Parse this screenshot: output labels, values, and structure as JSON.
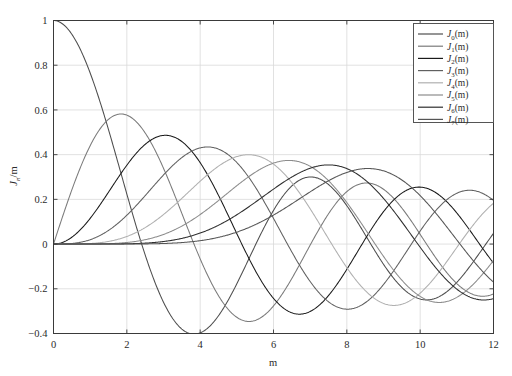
{
  "figure": {
    "background_color": "#ffffff",
    "frame_color": "#3a3a3a",
    "grid_color": "#d9d9d9"
  },
  "chart_data": {
    "type": "line",
    "title": "",
    "subtitle": "",
    "xlabel": "m",
    "ylabel": "J_n/m",
    "xlim": [
      0,
      12
    ],
    "ylim": [
      -0.4,
      1.0
    ],
    "xticks": [
      0,
      2,
      4,
      6,
      8,
      10,
      12
    ],
    "xticklabels": [
      "0",
      "2",
      "4",
      "6",
      "8",
      "10",
      "12"
    ],
    "yticks": [
      -0.4,
      -0.2,
      0,
      0.2,
      0.4,
      0.6,
      0.8,
      1.0
    ],
    "yticklabels": [
      "-0.4",
      "-0.2",
      "0",
      "0.2",
      "0.4",
      "0.6",
      "0.8",
      "1"
    ],
    "grid": true,
    "legend_position": "upper right",
    "colormap": "grayscale",
    "x": [
      0,
      0.15,
      0.3,
      0.45,
      0.6,
      0.75,
      0.9,
      1.05,
      1.2,
      1.35,
      1.5,
      1.65,
      1.8,
      1.95,
      2.1,
      2.25,
      2.4,
      2.55,
      2.7,
      2.85,
      3,
      3.15,
      3.3,
      3.45,
      3.6,
      3.75,
      3.9,
      4.05,
      4.2,
      4.35,
      4.5,
      4.65,
      4.8,
      4.95,
      5.1,
      5.25,
      5.4,
      5.55,
      5.7,
      5.85,
      6,
      6.15,
      6.3,
      6.45,
      6.6,
      6.75,
      6.9,
      7.05,
      7.2,
      7.35,
      7.5,
      7.65,
      7.8,
      7.95,
      8.1,
      8.25,
      8.4,
      8.55,
      8.7,
      8.85,
      9,
      9.15,
      9.3,
      9.45,
      9.6,
      9.75,
      9.9,
      10.05,
      10.2,
      10.35,
      10.5,
      10.65,
      10.8,
      10.95,
      11.1,
      11.25,
      11.4,
      11.55,
      11.7,
      11.85,
      12
    ],
    "series": [
      {
        "name": "J_0(m)",
        "label": "J0(m)",
        "order": 0,
        "color": "#4d4d4d",
        "first_zero": 2.405,
        "first_min": {
          "x": 3.83,
          "y": -0.403
        },
        "values": [
          1,
          0.9944,
          0.9776,
          0.95,
          0.912,
          0.8642,
          0.8075,
          0.7427,
          0.6711,
          0.5937,
          0.5118,
          0.4268,
          0.34,
          0.2528,
          0.1666,
          0.0827,
          0.0025,
          -0.0729,
          -0.1424,
          -0.2051,
          -0.2601,
          -0.3067,
          -0.3443,
          -0.3727,
          -0.3918,
          -0.4014,
          -0.4018,
          -0.3933,
          -0.3766,
          -0.3522,
          -0.3205,
          -0.2835,
          -0.2404,
          -0.1938,
          -0.1443,
          -0.093,
          -0.0412,
          0.0099,
          0.0599,
          0.1069,
          0.1506,
          0.1895,
          0.2238,
          0.2518,
          0.274,
          0.2891,
          0.2981,
          0.2998,
          0.2951,
          0.2841,
          0.2663,
          0.2441,
          0.2154,
          0.1833,
          0.1475,
          0.1093,
          0.0692,
          0.029,
          -0.0104,
          -0.048,
          -0.0903,
          -0.1206,
          -0.1467,
          -0.1697,
          -0.1872,
          -0.1992,
          -0.2055,
          -0.206,
          -0.2008,
          -0.1903,
          -0.175,
          -0.1555,
          -0.1323,
          -0.1063,
          -0.0781,
          -0.0488,
          -0.0189,
          0.0108,
          0.0395,
          0.0664,
          0.0907
        ]
      },
      {
        "name": "J_1(m)",
        "label": "J1(m)",
        "order": 1,
        "color": "#7a7a7a",
        "first_max": {
          "x": 1.84,
          "y": 0.582
        },
        "values": [
          0,
          0.0748,
          0.1483,
          0.2194,
          0.2867,
          0.3492,
          0.4059,
          0.4557,
          0.4983,
          0.5325,
          0.5579,
          0.5743,
          0.5815,
          0.5794,
          0.5683,
          0.5484,
          0.5202,
          0.4843,
          0.4416,
          0.3928,
          0.3391,
          0.2814,
          0.2207,
          0.1585,
          0.0955,
          0.0333,
          -0.0272,
          -0.0849,
          -0.1386,
          -0.1874,
          -0.2311,
          -0.2683,
          -0.2985,
          -0.3216,
          -0.3371,
          -0.3452,
          -0.346,
          -0.3396,
          -0.3265,
          -0.3071,
          -0.2767,
          -0.2476,
          -0.2136,
          -0.1761,
          -0.1361,
          -0.0947,
          -0.0527,
          -0.0113,
          0.0284,
          0.0663,
          0.1352,
          0.1643,
          0.189,
          0.2088,
          0.2235,
          0.2327,
          0.2364,
          0.2346,
          0.2274,
          0.215,
          0.2453,
          0.2291,
          0.2093,
          0.1861,
          0.16,
          0.1316,
          0.1015,
          0.0704,
          0.039,
          0.0081,
          -0.0216,
          -0.0493,
          -0.0743,
          -0.096,
          -0.1138,
          -0.1274,
          -0.1364,
          -0.1407,
          -0.1403,
          -0.1353,
          -0.1231
        ]
      },
      {
        "name": "J_2(m)",
        "label": "J2(m)",
        "order": 2,
        "color": "#1a1a1a",
        "first_max": {
          "x": 3.05,
          "y": 0.486
        },
        "values": [
          0,
          0.0028,
          0.0112,
          0.0249,
          0.0437,
          0.0673,
          0.095,
          0.1263,
          0.1604,
          0.1965,
          0.2321,
          0.2683,
          0.3028,
          0.3346,
          0.3629,
          0.3868,
          0.4059,
          0.4197,
          0.4278,
          0.4303,
          0.427,
          0.4182,
          0.4041,
          0.3851,
          0.3617,
          0.3344,
          0.3035,
          0.2699,
          0.234,
          0.1966,
          0.1584,
          0.1199,
          0.0818,
          0.0447,
          0.0092,
          -0.0243,
          -0.0553,
          -0.0835,
          -0.1085,
          -0.13,
          -0.1506,
          -0.1637,
          -0.1732,
          -0.179,
          -0.1809,
          -0.1792,
          -0.1739,
          -0.1653,
          -0.1537,
          -0.1394,
          -0.1228,
          -0.1043,
          -0.0843,
          -0.0634,
          -0.0419,
          -0.0203,
          0.001,
          0.0215,
          0.0409,
          0.0588,
          0.0849,
          0.0994,
          0.1117,
          0.1214,
          0.1285,
          0.1328,
          0.1343,
          0.133,
          0.1289,
          0.1223,
          0.1133,
          0.1022,
          0.0893,
          0.0749,
          0.0594,
          0.0432,
          0.0267,
          0.0102,
          -0.0059,
          -0.0214,
          -0.0849
        ]
      },
      {
        "name": "J_3(m)",
        "label": "J3(m)",
        "order": 3,
        "color": "#606060",
        "first_max": {
          "x": 4.2,
          "y": 0.434
        },
        "values": [
          0,
          0.0001,
          0.0006,
          0.0019,
          0.0044,
          0.0085,
          0.0144,
          0.0225,
          0.0329,
          0.0457,
          0.061,
          0.0787,
          0.0988,
          0.1209,
          0.1448,
          0.1702,
          0.1966,
          0.2235,
          0.2504,
          0.2767,
          0.3091,
          0.3243,
          0.3456,
          0.3648,
          0.3816,
          0.3957,
          0.4069,
          0.415,
          0.4198,
          0.4212,
          0.4193,
          0.4139,
          0.4052,
          0.3933,
          0.3783,
          0.3605,
          0.34,
          0.3172,
          0.2923,
          0.2657,
          0.1148,
          0.2084,
          0.178,
          0.147,
          0.1156,
          0.0843,
          0.0535,
          0.0235,
          -0.0053,
          -0.0325,
          -0.0617,
          -0.083,
          -0.103,
          -0.1207,
          -0.1358,
          -0.1482,
          -0.1577,
          -0.1642,
          -0.1677,
          -0.1682,
          -0.1809,
          -0.1776,
          -0.1716,
          -0.1631,
          -0.1523,
          -0.1394,
          -0.1247,
          -0.1085,
          -0.0912,
          -0.0731,
          -0.0545,
          -0.0358,
          -0.0173,
          0.0007,
          0.018,
          0.0344,
          0.0496,
          0.0634,
          0.0757,
          0.0862,
          0.1109
        ]
      },
      {
        "name": "J_4(m)",
        "label": "J4(m)",
        "order": 4,
        "color": "#b0b0b0",
        "first_max": {
          "x": 5.32,
          "y": 0.399
        },
        "values": [
          0,
          0.0,
          0.0,
          0.0001,
          0.0003,
          0.0008,
          0.0016,
          0.003,
          0.005,
          0.0079,
          0.0118,
          0.0169,
          0.0232,
          0.031,
          0.0402,
          0.051,
          0.0634,
          0.0774,
          0.0929,
          0.1099,
          0.132,
          0.1473,
          0.1675,
          0.1883,
          0.2095,
          0.2307,
          0.2518,
          0.2724,
          0.2922,
          0.3109,
          0.3284,
          0.3442,
          0.3582,
          0.3702,
          0.3799,
          0.3872,
          0.3919,
          0.394,
          0.3934,
          0.3901,
          0.3576,
          0.3757,
          0.3648,
          0.3515,
          0.336,
          0.3184,
          0.2988,
          0.2775,
          0.2546,
          0.2305,
          0.1981,
          0.179,
          0.1529,
          0.1265,
          0.0999,
          0.0734,
          0.0473,
          0.0218,
          -0.0028,
          -0.0263,
          -0.055,
          -0.0693,
          -0.0885,
          -0.106,
          -0.1216,
          -0.1352,
          -0.1466,
          -0.1557,
          -0.1624,
          -0.1666,
          -0.1684,
          -0.1678,
          -0.1648,
          -0.1595,
          -0.152,
          -0.1425,
          -0.1312,
          -0.1182,
          -0.1039,
          -0.0885,
          -0.0277
        ]
      },
      {
        "name": "J_5(m)",
        "label": "J5(m)",
        "order": 5,
        "color": "#8c8c8c",
        "first_max": {
          "x": 6.41,
          "y": 0.374
        },
        "values": [
          0,
          0.0,
          0.0,
          0.0,
          0.0,
          0.0001,
          0.0003,
          0.0006,
          0.0012,
          0.0021,
          0.0035,
          0.0056,
          0.0084,
          0.0122,
          0.0171,
          0.0232,
          0.0306,
          0.0395,
          0.0499,
          0.0618,
          0.043,
          0.0904,
          0.1067,
          0.1242,
          0.1427,
          0.1621,
          0.182,
          0.2022,
          0.2225,
          0.2425,
          0.2621,
          0.2809,
          0.2987,
          0.3152,
          0.3302,
          0.3434,
          0.3547,
          0.3639,
          0.3708,
          0.3754,
          0.3621,
          0.3774,
          0.3746,
          0.3691,
          0.3611,
          0.3504,
          0.3373,
          0.3217,
          0.3039,
          0.284,
          0.2538,
          0.2376,
          0.212,
          0.1857,
          0.1584,
          0.1306,
          0.1026,
          0.0746,
          0.0471,
          0.0203,
          -0.055,
          -0.0303,
          -0.0533,
          -0.0746,
          -0.0938,
          -0.1108,
          -0.1255,
          -0.1376,
          -0.147,
          -0.1537,
          -0.1577,
          -0.1589,
          -0.1575,
          -0.1535,
          -0.147,
          -0.1383,
          -0.1274,
          -0.1147,
          -0.1005,
          -0.085,
          -0.0735
        ]
      },
      {
        "name": "J_6(m)",
        "label": "J6(m)",
        "order": 6,
        "color": "#2e2e2e",
        "first_max": {
          "x": 7.5,
          "y": 0.354
        },
        "values": [
          0,
          0.0,
          0.0,
          0.0,
          0.0,
          0.0,
          0.0,
          0.0001,
          0.0002,
          0.0004,
          0.0009,
          0.0015,
          0.0025,
          0.0039,
          0.0058,
          0.0084,
          0.0118,
          0.0161,
          0.0214,
          0.0279,
          0.0114,
          0.0447,
          0.0555,
          0.0678,
          0.0815,
          0.0966,
          0.1131,
          0.1307,
          0.1492,
          0.1685,
          0.1881,
          0.2079,
          0.2275,
          0.2467,
          0.2651,
          0.2824,
          0.2984,
          0.3127,
          0.3252,
          0.3356,
          0.2458,
          0.3496,
          0.3527,
          0.353,
          0.3505,
          0.3452,
          0.3371,
          0.3263,
          0.3128,
          0.2969,
          0.2787,
          0.2528,
          0.2298,
          0.2054,
          0.1798,
          0.1532,
          0.1259,
          0.0982,
          0.0704,
          0.0428,
          0.0454,
          -0.0107,
          -0.0358,
          -0.0594,
          -0.0812,
          -0.1009,
          -0.1183,
          -0.1331,
          -0.1452,
          -0.1544,
          -0.1605,
          -0.1636,
          -0.1637,
          -0.1608,
          -0.155,
          -0.1465,
          -0.1354,
          -0.1221,
          -0.1068,
          -0.0898,
          -0.2437
        ]
      },
      {
        "name": "J_7(m)",
        "label": "J7(m)",
        "order": 7,
        "color": "#555555",
        "first_max": {
          "x": 8.58,
          "y": 0.338
        },
        "values": [
          0,
          0.0,
          0.0,
          0.0,
          0.0,
          0.0,
          0.0,
          0.0,
          0.0,
          0.0001,
          0.0002,
          0.0004,
          0.0006,
          0.0011,
          0.0017,
          0.0027,
          0.004,
          0.0057,
          0.008,
          0.0109,
          0.0025,
          0.0192,
          0.0248,
          0.0316,
          0.0394,
          0.0484,
          0.0586,
          0.0701,
          0.0828,
          0.0966,
          0.1115,
          0.1273,
          0.144,
          0.1612,
          0.1789,
          0.1967,
          0.2144,
          0.2318,
          0.2486,
          0.2646,
          0.1296,
          0.2932,
          0.3054,
          0.3158,
          0.3244,
          0.3309,
          0.3353,
          0.3375,
          0.3374,
          0.335,
          0.3206,
          0.3232,
          0.3138,
          0.3021,
          0.2884,
          0.2725,
          0.2547,
          0.235,
          0.2137,
          0.191,
          0.1672,
          0.1425,
          0.1172,
          0.0915,
          0.0657,
          0.0401,
          0.0149,
          -0.0094,
          -0.0329,
          -0.0551,
          -0.0759,
          -0.0949,
          -0.112,
          -0.1269,
          -0.1396,
          -0.1497,
          -0.1574,
          -0.1624,
          -0.1648,
          -0.1646,
          -0.1703
        ]
      }
    ]
  },
  "legend": {
    "entries": [
      {
        "prefix": "J",
        "sub": "0",
        "suffix": "(m)"
      },
      {
        "prefix": "J",
        "sub": "1",
        "suffix": "(m)"
      },
      {
        "prefix": "J",
        "sub": "2",
        "suffix": "(m)"
      },
      {
        "prefix": "J",
        "sub": "3",
        "suffix": "(m)"
      },
      {
        "prefix": "J",
        "sub": "4",
        "suffix": "(m)"
      },
      {
        "prefix": "J",
        "sub": "5",
        "suffix": "(m)"
      },
      {
        "prefix": "J",
        "sub": "6",
        "suffix": "(m)"
      },
      {
        "prefix": "J",
        "sub": "7",
        "suffix": "(m)"
      }
    ]
  },
  "axis_titles": {
    "x": "m",
    "y_main": "J",
    "y_sub": "n",
    "y_tail": "/m"
  }
}
